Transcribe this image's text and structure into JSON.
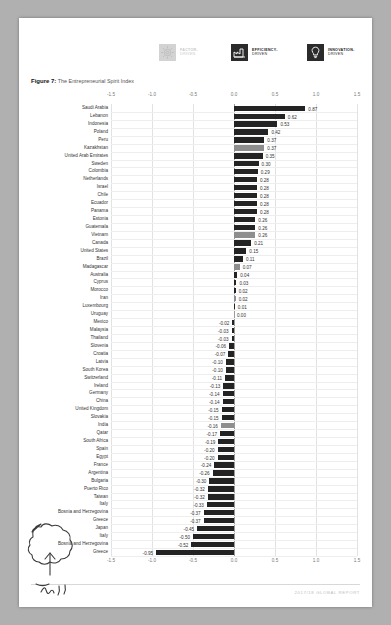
{
  "document": {
    "footer": "2017/18 GLOBAL REPORT",
    "caption_prefix": "Figure 7:",
    "caption_text": " The Entrepreneurial Spirit Index"
  },
  "legend": {
    "items": [
      {
        "label_top": "FACTOR-",
        "label_bottom": "DRIVEN",
        "icon": "gear-icon",
        "color": "#d3d3d3",
        "text_color": "#c9c9c9"
      },
      {
        "label_top": "EFFICIENCY-",
        "label_bottom": "DRIVEN",
        "icon": "factory-icon",
        "color": "#2b2b2b",
        "text_color": "#1a1a1a"
      },
      {
        "label_top": "INNOVATION-",
        "label_bottom": "DRIVEN",
        "icon": "lightbulb-icon",
        "color": "#2b2b2b",
        "text_color": "#1a1a1a"
      }
    ]
  },
  "annotation": {
    "note": "handwritten circle and arrow around Japan",
    "scribble_text": "Ih.!!"
  },
  "chart_data": {
    "type": "bar",
    "orientation": "horizontal",
    "title": "The Entrepreneurial Spirit Index",
    "xlabel": "",
    "ylabel": "",
    "xlim": [
      -1.5,
      1.5
    ],
    "xticks": [
      -1.5,
      -1.0,
      -0.5,
      0.0,
      0.5,
      1.0,
      1.5
    ],
    "xtick_labels": [
      "-1.5",
      "-1.0",
      "-0.5",
      "0.0",
      "0.5",
      "1.0",
      "1.5"
    ],
    "grid": true,
    "legend_position": "top",
    "categories": [
      "Saudi Arabia",
      "Lebanon",
      "Indonesia",
      "Poland",
      "Peru",
      "Kazakhstan",
      "United Arab Emirates",
      "Sweden",
      "Colombia",
      "Netherlands",
      "Israel",
      "Chile",
      "Ecuador",
      "Panama",
      "Estonia",
      "Guatemala",
      "Vietnam",
      "Canada",
      "United States",
      "Brazil",
      "Madagascar",
      "Australia",
      "Cyprus",
      "Morocco",
      "Iran",
      "Luxembourg",
      "Uruguay",
      "Mexico",
      "Malaysia",
      "Thailand",
      "Slovenia",
      "Croatia",
      "Latvia",
      "South Korea",
      "Switzerland",
      "Ireland",
      "Germany",
      "China",
      "United Kingdom",
      "Slovakia",
      "India",
      "Qatar",
      "South Africa",
      "Spain",
      "Egypt",
      "France",
      "Argentina",
      "Bulgaria",
      "Puerto Rico",
      "Taiwan",
      "Italy",
      "Bosnia and Herzegovina",
      "Greece",
      "Japan"
    ],
    "values": [
      0.87,
      0.62,
      0.53,
      0.42,
      0.37,
      0.37,
      0.35,
      0.3,
      0.29,
      0.28,
      0.28,
      0.28,
      0.28,
      0.28,
      0.26,
      0.26,
      0.26,
      0.21,
      0.15,
      0.11,
      0.07,
      0.04,
      0.03,
      0.02,
      0.02,
      0.01,
      0.0,
      -0.02,
      -0.03,
      -0.03,
      -0.06,
      -0.07,
      -0.1,
      -0.1,
      -0.11,
      -0.13,
      -0.14,
      -0.14,
      -0.15,
      -0.15,
      -0.16,
      -0.17,
      -0.19,
      -0.2,
      -0.2,
      -0.24,
      -0.26,
      -0.3,
      -0.32,
      -0.32,
      -0.33,
      -0.37,
      -0.37,
      -0.45
    ],
    "value_labels": [
      "0.87",
      "0.62",
      "0.53",
      "0.42",
      "0.37",
      "0.37",
      "0.35",
      "0.30",
      "0.29",
      "0.28",
      "0.28",
      "0.28",
      "0.28",
      "0.28",
      "0.26",
      "0.26",
      "0.26",
      "0.21",
      "0.15",
      "0.11",
      "0.07",
      "0.04",
      "0.03",
      "0.02",
      "0.02",
      "0.01",
      "0.00",
      "-0.02",
      "-0.03",
      "-0.03",
      "-0.06",
      "-0.07",
      "-0.10",
      "-0.10",
      "-0.11",
      "-0.13",
      "-0.14",
      "-0.14",
      "-0.15",
      "-0.15",
      "-0.16",
      "-0.17",
      "-0.19",
      "-0.20",
      "-0.20",
      "-0.24",
      "-0.26",
      "-0.30",
      "-0.32",
      "-0.32",
      "-0.33",
      "-0.37",
      "-0.37",
      "-0.45"
    ],
    "groups": [
      "efficiency",
      "efficiency",
      "efficiency",
      "efficiency",
      "efficiency",
      "factor",
      "innovation",
      "innovation",
      "efficiency",
      "innovation",
      "innovation",
      "efficiency",
      "efficiency",
      "efficiency",
      "innovation",
      "efficiency",
      "factor",
      "innovation",
      "innovation",
      "efficiency",
      "factor",
      "innovation",
      "innovation",
      "efficiency",
      "factor",
      "innovation",
      "efficiency",
      "efficiency",
      "efficiency",
      "efficiency",
      "innovation",
      "efficiency",
      "innovation",
      "innovation",
      "innovation",
      "innovation",
      "innovation",
      "efficiency",
      "innovation",
      "innovation",
      "factor",
      "innovation",
      "efficiency",
      "innovation",
      "efficiency",
      "innovation",
      "efficiency",
      "efficiency",
      "innovation",
      "innovation",
      "innovation",
      "efficiency",
      "innovation",
      "innovation"
    ],
    "extra_rows": [
      {
        "category": "Italy",
        "value": -0.5,
        "label": "-0.50",
        "group": "innovation"
      },
      {
        "category": "Bosnia and Herzegovina",
        "value": -0.52,
        "label": "-0.52",
        "group": "efficiency"
      },
      {
        "category": "Greece",
        "value": -0.95,
        "label": "-0.95",
        "group": "innovation"
      }
    ],
    "colors": {
      "factor": "#8e8e8e",
      "efficiency": "#232323",
      "innovation": "#232323"
    }
  }
}
